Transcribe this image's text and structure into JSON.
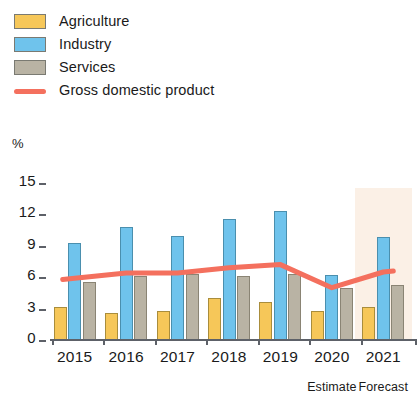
{
  "legend": {
    "items": [
      {
        "label": "Agriculture",
        "swatch": "agriculture-swatch",
        "color": "#f6c759"
      },
      {
        "label": "Industry",
        "swatch": "industry-swatch",
        "color": "#6fc3ec"
      },
      {
        "label": "Services",
        "swatch": "services-swatch",
        "color": "#b9b3a4"
      },
      {
        "label": "Gross domestic product",
        "swatch": "gdp-line-swatch",
        "color": "#f4705e"
      }
    ]
  },
  "axis": {
    "unit": "%",
    "yticks": [
      "15",
      "12",
      "9",
      "6",
      "3",
      "0"
    ],
    "xticks": [
      "2015",
      "2016",
      "2017",
      "2018",
      "2019",
      "2020",
      "2021"
    ]
  },
  "notes": {
    "estimate": "Estimate",
    "forecast": "Forecast"
  },
  "chart_data": {
    "type": "bar",
    "title": "",
    "xlabel": "",
    "ylabel": "%",
    "ylim": [
      0,
      15
    ],
    "yticks": [
      0,
      3,
      6,
      9,
      12,
      15
    ],
    "grid": false,
    "legend_position": "top-left",
    "categories": [
      "2015",
      "2016",
      "2017",
      "2018",
      "2019",
      "2020",
      "2021"
    ],
    "series": [
      {
        "name": "Agriculture",
        "type": "bar",
        "color": "#f6c759",
        "values": [
          3.2,
          2.6,
          2.8,
          4.0,
          3.6,
          2.8,
          3.2
        ]
      },
      {
        "name": "Industry",
        "type": "bar",
        "color": "#6fc3ec",
        "values": [
          9.3,
          10.8,
          9.9,
          11.6,
          12.3,
          6.2,
          9.8
        ]
      },
      {
        "name": "Services",
        "type": "bar",
        "color": "#b9b3a4",
        "values": [
          5.5,
          6.1,
          6.3,
          6.1,
          6.3,
          5.0,
          5.3
        ]
      },
      {
        "name": "Gross domestic product",
        "type": "line",
        "color": "#f4705e",
        "values": [
          5.9,
          6.4,
          6.4,
          6.9,
          7.2,
          5.0,
          6.5
        ]
      }
    ],
    "annotations": [
      {
        "text": "Estimate",
        "x": "2020"
      },
      {
        "text": "Forecast",
        "x": "2021"
      }
    ],
    "shaded_region": {
      "from": "2020.5",
      "to": "2021.5",
      "color": "#fbf0e6",
      "label": "forecast period"
    }
  }
}
